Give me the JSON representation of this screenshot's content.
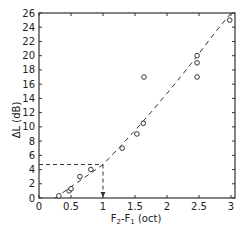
{
  "chart_data": {
    "type": "scatter",
    "title": "",
    "xlabel": "F2-F1 (oct)",
    "xlabel_main": "F",
    "xlabel_sub1": "2",
    "xlabel_mid": "-F",
    "xlabel_sub2": "1",
    "xlabel_unit": " (oct)",
    "ylabel": "ΔL (dB)",
    "xlim": [
      0,
      3
    ],
    "ylim": [
      0,
      26
    ],
    "xticks": [
      0,
      0.5,
      1,
      1.5,
      2,
      2.5,
      3
    ],
    "xtick_labels": [
      "0",
      "0.5",
      "1",
      "1.5",
      "2",
      "2.5",
      "3"
    ],
    "yticks": [
      0,
      2,
      4,
      6,
      8,
      10,
      12,
      14,
      16,
      18,
      20,
      22,
      24,
      26
    ],
    "ytick_labels": [
      "0",
      "2",
      "4",
      "6",
      "8",
      "10",
      "12",
      "14",
      "16",
      "18",
      "20",
      "22",
      "24",
      "26"
    ],
    "grid": false,
    "legend": null,
    "series": [
      {
        "name": "measurements",
        "marker": "open-circle",
        "x": [
          0.31,
          0.47,
          0.5,
          0.64,
          0.81,
          1.3,
          1.53,
          1.63,
          1.64,
          2.47,
          2.47,
          2.47,
          2.98
        ],
        "y": [
          0.3,
          1.0,
          1.3,
          3.0,
          4.0,
          7.0,
          9.0,
          10.5,
          17.0,
          20.0,
          19.0,
          17.0,
          25.0
        ]
      },
      {
        "name": "fit",
        "style": "dashed",
        "x": [
          0.25,
          1.0,
          3.0
        ],
        "y": [
          0.0,
          4.7,
          25.5
        ]
      }
    ],
    "annotations": [
      {
        "type": "dashed-guide",
        "description": "horizontal from y-axis to curve at y≈4.7",
        "x": [
          0,
          1.0
        ],
        "y": [
          4.7,
          4.7
        ]
      },
      {
        "type": "dashed-guide",
        "description": "vertical from curve to x-axis at x=1 with arrow",
        "x": [
          1.0,
          1.0
        ],
        "y": [
          4.7,
          0
        ]
      }
    ]
  },
  "frame": {
    "left": 39,
    "right": 235,
    "top": 13,
    "bottom": 198,
    "x_at_3": 231
  }
}
